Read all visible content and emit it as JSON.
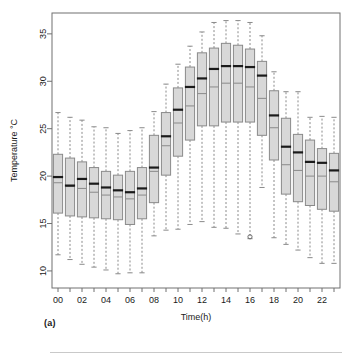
{
  "figure": {
    "panel_label": "(a)"
  },
  "chart_data": {
    "type": "box",
    "title": "",
    "subtitle": "",
    "xlabel": "Time(h)",
    "ylabel": "Temperature °C",
    "grid": false,
    "legend": null,
    "ylim": [
      8.2,
      37.2
    ],
    "yticks": [
      10,
      15,
      20,
      25,
      30,
      35
    ],
    "ytick_labels": [
      "10",
      "15",
      "20",
      "25",
      "30",
      "35"
    ],
    "xtick_labels": [
      "00",
      "02",
      "04",
      "06",
      "08",
      "10",
      "12",
      "14",
      "16",
      "18",
      "20",
      "22"
    ],
    "xtick_every": 2,
    "categories": [
      "00",
      "01",
      "02",
      "03",
      "04",
      "05",
      "06",
      "07",
      "08",
      "09",
      "10",
      "11",
      "12",
      "13",
      "14",
      "15",
      "16",
      "17",
      "18",
      "19",
      "20",
      "21",
      "22",
      "23"
    ],
    "box_fill": "#d8d8d8",
    "box_edge": "#8a8a8a",
    "median_color": "#1a1a1a",
    "mean_color": "#8a8a8a",
    "whisker_color": "#8a8a8a",
    "boxes": [
      {
        "category": "00",
        "lower_whisker": 11.7,
        "q1": 16.1,
        "median": 19.9,
        "mean": 19.3,
        "q3": 22.3,
        "upper_whisker": 26.7,
        "outliers": []
      },
      {
        "category": "01",
        "lower_whisker": 11.2,
        "q1": 15.8,
        "median": 19.0,
        "mean": 18.9,
        "q3": 21.9,
        "upper_whisker": 26.2,
        "outliers": []
      },
      {
        "category": "02",
        "lower_whisker": 10.7,
        "q1": 15.7,
        "median": 19.7,
        "mean": 18.7,
        "q3": 21.5,
        "upper_whisker": 25.9,
        "outliers": []
      },
      {
        "category": "03",
        "lower_whisker": 10.4,
        "q1": 15.6,
        "median": 19.2,
        "mean": 18.3,
        "q3": 20.9,
        "upper_whisker": 25.2,
        "outliers": []
      },
      {
        "category": "04",
        "lower_whisker": 10.1,
        "q1": 15.5,
        "median": 18.8,
        "mean": 18.0,
        "q3": 20.5,
        "upper_whisker": 25.1,
        "outliers": []
      },
      {
        "category": "05",
        "lower_whisker": 9.7,
        "q1": 15.4,
        "median": 18.5,
        "mean": 17.8,
        "q3": 20.1,
        "upper_whisker": 24.5,
        "outliers": []
      },
      {
        "category": "06",
        "lower_whisker": 9.8,
        "q1": 14.9,
        "median": 18.3,
        "mean": 17.6,
        "q3": 20.5,
        "upper_whisker": 24.8,
        "outliers": []
      },
      {
        "category": "07",
        "lower_whisker": 9.8,
        "q1": 15.5,
        "median": 18.7,
        "mean": 18.0,
        "q3": 20.9,
        "upper_whisker": 25.1,
        "outliers": []
      },
      {
        "category": "08",
        "lower_whisker": 13.7,
        "q1": 17.2,
        "median": 20.9,
        "mean": 20.5,
        "q3": 24.3,
        "upper_whisker": 26.8,
        "outliers": []
      },
      {
        "category": "09",
        "lower_whisker": 14.3,
        "q1": 20.1,
        "median": 24.2,
        "mean": 23.2,
        "q3": 26.7,
        "upper_whisker": 29.7,
        "outliers": []
      },
      {
        "category": "10",
        "lower_whisker": 14.4,
        "q1": 22.1,
        "median": 27.0,
        "mean": 25.6,
        "q3": 29.3,
        "upper_whisker": 31.8,
        "outliers": []
      },
      {
        "category": "11",
        "lower_whisker": 14.9,
        "q1": 23.8,
        "median": 29.4,
        "mean": 27.4,
        "q3": 31.5,
        "upper_whisker": 33.7,
        "outliers": []
      },
      {
        "category": "12",
        "lower_whisker": 15.2,
        "q1": 25.3,
        "median": 30.3,
        "mean": 28.7,
        "q3": 33.0,
        "upper_whisker": 35.2,
        "outliers": []
      },
      {
        "category": "13",
        "lower_whisker": 14.6,
        "q1": 25.3,
        "median": 31.3,
        "mean": 29.4,
        "q3": 33.5,
        "upper_whisker": 36.2,
        "outliers": []
      },
      {
        "category": "14",
        "lower_whisker": 14.5,
        "q1": 25.7,
        "median": 31.6,
        "mean": 29.8,
        "q3": 34.0,
        "upper_whisker": 36.4,
        "outliers": []
      },
      {
        "category": "15",
        "lower_whisker": 13.9,
        "q1": 25.7,
        "median": 31.6,
        "mean": 29.8,
        "q3": 33.8,
        "upper_whisker": 36.4,
        "outliers": []
      },
      {
        "category": "16",
        "lower_whisker": 13.4,
        "q1": 25.7,
        "median": 31.5,
        "mean": 29.4,
        "q3": 33.4,
        "upper_whisker": 36.2,
        "outliers": [
          13.6
        ]
      },
      {
        "category": "17",
        "lower_whisker": 18.8,
        "q1": 24.3,
        "median": 30.6,
        "mean": 28.2,
        "q3": 32.1,
        "upper_whisker": 34.8,
        "outliers": []
      },
      {
        "category": "18",
        "lower_whisker": 13.5,
        "q1": 21.7,
        "median": 26.4,
        "mean": 25.1,
        "q3": 29.0,
        "upper_whisker": 31.0,
        "outliers": []
      },
      {
        "category": "19",
        "lower_whisker": 12.8,
        "q1": 18.1,
        "median": 23.1,
        "mean": 21.2,
        "q3": 26.1,
        "upper_whisker": 28.9,
        "outliers": []
      },
      {
        "category": "20",
        "lower_whisker": 12.2,
        "q1": 17.3,
        "median": 22.5,
        "mean": 20.6,
        "q3": 24.4,
        "upper_whisker": 28.9,
        "outliers": []
      },
      {
        "category": "21",
        "lower_whisker": 11.4,
        "q1": 16.9,
        "median": 21.5,
        "mean": 20.0,
        "q3": 23.8,
        "upper_whisker": 26.2,
        "outliers": []
      },
      {
        "category": "22",
        "lower_whisker": 10.8,
        "q1": 16.5,
        "median": 21.4,
        "mean": 20.0,
        "q3": 22.9,
        "upper_whisker": 26.3,
        "outliers": []
      },
      {
        "category": "23",
        "lower_whisker": 10.8,
        "q1": 16.3,
        "median": 20.6,
        "mean": 19.4,
        "q3": 22.4,
        "upper_whisker": 26.2,
        "outliers": []
      }
    ]
  }
}
